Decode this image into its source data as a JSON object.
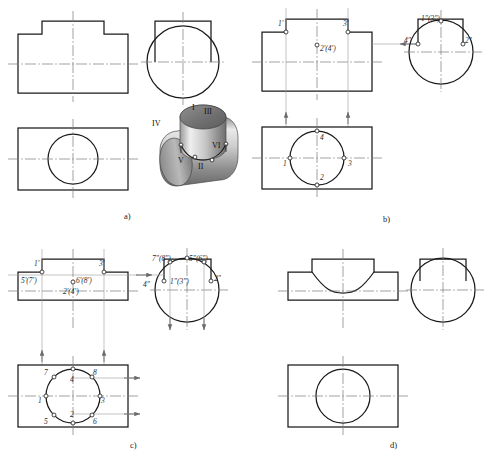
{
  "figure": {
    "line_colors": {
      "outline": "#1a1a1a",
      "center_line": "#7a7a7a",
      "projection_line": "#8a8a8a",
      "label_text": "#2b2b2b",
      "solid_light": "#d9d9d9",
      "solid_mid": "#a8a8a8",
      "solid_dark": "#6e6e6e"
    }
  },
  "panels": [
    {
      "id": "a",
      "caption": "a)",
      "views": [
        "front-view",
        "side-view",
        "top-view",
        "pictorial-view"
      ],
      "pictorial_labels": [
        "I",
        "II",
        "III",
        "IV",
        "V",
        "VI"
      ]
    },
    {
      "id": "b",
      "caption": "b)",
      "views": [
        "front-view",
        "side-view",
        "top-view"
      ],
      "front_labels": [
        "1'",
        "3'",
        "2'(4')"
      ],
      "side_labels": [
        "1\"(3\")",
        "4\"",
        "2\""
      ],
      "top_labels": [
        "1",
        "2",
        "3",
        "4"
      ]
    },
    {
      "id": "c",
      "caption": "c)",
      "views": [
        "front-view",
        "side-view",
        "top-view"
      ],
      "front_labels": [
        "1'",
        "3'",
        "5'(7')",
        "6'(8')",
        "2'(4')"
      ],
      "side_labels": [
        "7\"(8\")",
        "5\"(6\")",
        "1\"(3\")",
        "4\"",
        "2\""
      ],
      "top_labels": [
        "7",
        "4",
        "8",
        "1",
        "3",
        "5",
        "2",
        "6"
      ]
    },
    {
      "id": "d",
      "caption": "d)",
      "views": [
        "front-view",
        "side-view",
        "top-view"
      ],
      "front_labels": [],
      "side_labels": [],
      "top_labels": []
    }
  ],
  "labels": {
    "panel_a": {
      "caption": "a)",
      "pictorial": {
        "I": "I",
        "II": "II",
        "III": "III",
        "IV": "IV",
        "V": "V",
        "VI": "VI"
      }
    },
    "panel_b": {
      "caption": "b)",
      "front": {
        "p1": "1'",
        "p3": "3'",
        "p24": "2'(4')"
      },
      "side": {
        "p13": "1\"(3\")",
        "p4": "4\"",
        "p2": "2\""
      },
      "top": {
        "p1": "1",
        "p2": "2",
        "p3": "3",
        "p4": "4"
      }
    },
    "panel_c": {
      "caption": "c)",
      "front": {
        "p1": "1'",
        "p3": "3'",
        "p57": "5'(7')",
        "p68": "6'(8')",
        "p24": "2'(4')"
      },
      "side": {
        "p78": "7\"(8\")",
        "p56": "5\"(6\")",
        "p13": "1\"(3\")",
        "p4": "4\"",
        "p2": "2\""
      },
      "top": {
        "p7": "7",
        "p4": "4",
        "p8": "8",
        "p1": "1",
        "p3": "3",
        "p5": "5",
        "p2": "2",
        "p6": "6"
      }
    },
    "panel_d": {
      "caption": "d)"
    }
  }
}
